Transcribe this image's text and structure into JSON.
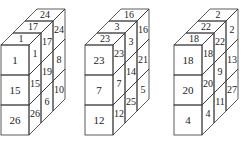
{
  "figures": [
    {
      "name": "cuboid-1",
      "origin_x": 0,
      "front": [
        "1",
        "15",
        "26"
      ],
      "top": [
        "1",
        "17",
        "24"
      ],
      "side": [
        [
          "1",
          "17",
          "24"
        ],
        [
          "15",
          "19",
          "8"
        ],
        [
          "26",
          "6",
          "10"
        ]
      ]
    },
    {
      "name": "cuboid-2",
      "origin_x": 84,
      "front": [
        "23",
        "7",
        "12"
      ],
      "top": [
        "23",
        "3",
        "16"
      ],
      "side": [
        [
          "23",
          "3",
          "16"
        ],
        [
          "7",
          "14",
          "21"
        ],
        [
          "12",
          "25",
          "5"
        ]
      ]
    },
    {
      "name": "cuboid-3",
      "origin_x": 173,
      "front": [
        "18",
        "20",
        "4"
      ],
      "top": [
        "18",
        "22",
        "2"
      ],
      "side": [
        [
          "18",
          "22",
          "2"
        ],
        [
          "20",
          "9",
          "13"
        ],
        [
          "4",
          "11",
          "27"
        ]
      ]
    }
  ],
  "geometry": {
    "front_width": 28,
    "row_height": 30,
    "front_top": 45,
    "depth_dx": 12,
    "depth_dy": 12,
    "layers": 3
  }
}
